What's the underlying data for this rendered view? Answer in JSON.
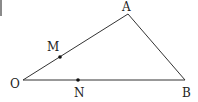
{
  "diagram": {
    "type": "geometry-triangle",
    "stroke_color": "#333333",
    "point_color": "#111111",
    "vertices": {
      "O": {
        "label": "O",
        "x": 23,
        "y": 80,
        "label_x": 10,
        "label_y": 88
      },
      "A": {
        "label": "A",
        "x": 128,
        "y": 14,
        "label_x": 122,
        "label_y": 11
      },
      "B": {
        "label": "B",
        "x": 185,
        "y": 80,
        "label_x": 182,
        "label_y": 97
      }
    },
    "points": {
      "M": {
        "label": "M",
        "on": "OA",
        "x": 60,
        "y": 57,
        "label_x": 47,
        "label_y": 51
      },
      "N": {
        "label": "N",
        "on": "OB",
        "x": 78,
        "y": 80,
        "label_x": 74,
        "label_y": 97
      }
    },
    "segments": [
      "OA",
      "AB",
      "OB"
    ]
  }
}
